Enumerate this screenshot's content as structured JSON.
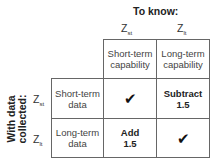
{
  "col_header": {
    "title": "To know:",
    "columns": [
      {
        "symbol": "Z",
        "subscript": "st",
        "label": "Short-term capability"
      },
      {
        "symbol": "Z",
        "subscript": "lt",
        "label": "Long-term capability"
      }
    ]
  },
  "row_header": {
    "title_line1": "With data",
    "title_line2": "collected:",
    "rows": [
      {
        "symbol": "Z",
        "subscript": "st",
        "label": "Short-term data"
      },
      {
        "symbol": "Z",
        "subscript": "lt",
        "label": "Long-term data"
      }
    ]
  },
  "cells": [
    [
      {
        "icon": "check-icon",
        "glyph": "✔"
      },
      {
        "line1": "Subtract",
        "line2": "1.5"
      }
    ],
    [
      {
        "line1": "Add",
        "line2": "1.5"
      },
      {
        "icon": "check-icon",
        "glyph": "✔"
      }
    ]
  ]
}
